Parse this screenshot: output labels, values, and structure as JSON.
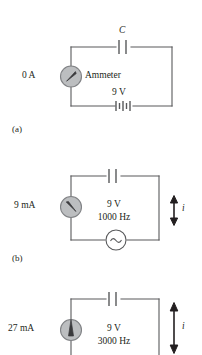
{
  "figure": {
    "line_color": "#58595b",
    "text_color": "#231f20",
    "meter_fill": "#bcbec0",
    "meter_stroke": "#808285",
    "background": "#ffffff"
  },
  "panels": [
    {
      "id": "a",
      "caption": "(a)",
      "meter_reading": "0 A",
      "meter_label": "Ammeter",
      "meter_needle": "up-right",
      "capacitor_label": "C",
      "source_type": "battery",
      "source_voltage": "9 V",
      "source_frequency": "",
      "current_arrow": false,
      "current_label": ""
    },
    {
      "id": "b",
      "caption": "(b)",
      "meter_reading": "9 mA",
      "meter_label": "",
      "meter_needle": "up-left",
      "capacitor_label": "",
      "source_type": "ac",
      "source_voltage": "9 V",
      "source_frequency": "1000 Hz",
      "current_arrow": true,
      "current_label": "i"
    },
    {
      "id": "c",
      "caption": "",
      "meter_reading": "27 mA",
      "meter_label": "",
      "meter_needle": "up",
      "capacitor_label": "",
      "source_type": "ac",
      "source_voltage": "9 V",
      "source_frequency": "3000 Hz",
      "current_arrow": true,
      "current_label": "i"
    }
  ]
}
